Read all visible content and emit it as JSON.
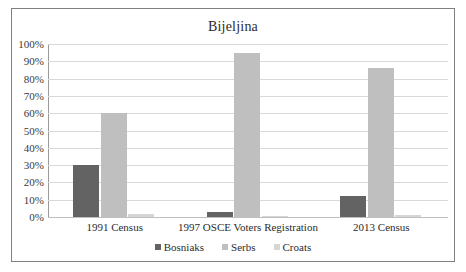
{
  "chart_data": {
    "type": "bar",
    "title": "Bijeljina",
    "xlabel": "",
    "ylabel": "",
    "ylim": [
      0,
      100
    ],
    "ytick_labels": [
      "100%",
      "90%",
      "80%",
      "70%",
      "60%",
      "50%",
      "40%",
      "30%",
      "20%",
      "10%",
      "0%"
    ],
    "ytick_values": [
      100,
      90,
      80,
      70,
      60,
      50,
      40,
      30,
      20,
      10,
      0
    ],
    "grid": true,
    "legend_position": "bottom",
    "categories": [
      "1991 Census",
      "1997 OSCE Voters Registration",
      "2013 Census"
    ],
    "series": [
      {
        "name": "Bosniaks",
        "color": "#636363",
        "values": [
          30,
          3,
          12
        ]
      },
      {
        "name": "Serbs",
        "color": "#bfbfbf",
        "values": [
          60,
          95,
          86
        ]
      },
      {
        "name": "Croats",
        "color": "#d6d6d6",
        "values": [
          1.5,
          0.5,
          1
        ]
      }
    ]
  },
  "colors": {
    "frame": "#808080",
    "gridline": "#d9d9d9",
    "axis": "#9a9a9a",
    "text": "#2b2b2b",
    "background": "#ffffff"
  }
}
